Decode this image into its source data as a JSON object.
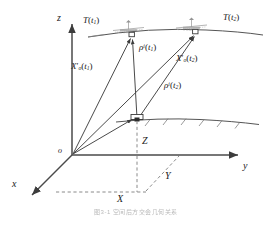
{
  "figure": {
    "type": "geometry-diagram",
    "title_caption": "图3-1   空间后方交会几何关系",
    "background_color": "#ffffff",
    "line_color": "#4a4a4a",
    "dash_color": "#8a8a8a",
    "text_color": "#1a1a1a"
  },
  "axes": {
    "z": {
      "label": "z",
      "dir": "up",
      "tip": [
        72,
        22
      ],
      "origin": [
        72,
        155
      ]
    },
    "y": {
      "label": "y",
      "dir": "right",
      "tip": [
        240,
        155
      ],
      "origin": [
        72,
        155
      ]
    },
    "x": {
      "label": "x",
      "dir": "down-left",
      "tip": [
        30,
        196
      ],
      "origin": [
        72,
        155
      ]
    },
    "origin_label": "o"
  },
  "labels": {
    "sat1": {
      "base": "T",
      "arg": "t",
      "argsub": "1"
    },
    "sat2": {
      "base": "T",
      "arg": "t",
      "argsub": "2"
    },
    "rho1": {
      "base": "ρ",
      "sup": "i",
      "arg": "t",
      "argsub": "1"
    },
    "rho2": {
      "base": "ρ",
      "sup": "i",
      "arg": "t",
      "argsub": "2"
    },
    "Xo1": {
      "base": "X",
      "prime": "′",
      "sub": "o",
      "arg": "t",
      "argsub": "1"
    },
    "Xo2": {
      "base": "X",
      "prime": "′",
      "sub": "o",
      "arg": "t",
      "argsub": "2"
    },
    "X": "X",
    "Y": "Y",
    "Z": "Z"
  },
  "points": {
    "origin": {
      "name": "o",
      "x": 72,
      "y": 155
    },
    "satellite1": {
      "name": "T(t1)",
      "x": 132,
      "y": 34
    },
    "satellite2": {
      "name": "T(t2)",
      "x": 196,
      "y": 31
    },
    "receiver": {
      "name": "station",
      "x": 137,
      "y": 119
    },
    "ground_proj": {
      "name": "ground-projection",
      "x": 137,
      "y": 155
    },
    "x_foot": {
      "name": "x-axis-foot",
      "x": 104,
      "y": 192
    },
    "xy_corner": {
      "name": "xy-corner",
      "x": 147,
      "y": 192
    }
  },
  "positions": {
    "z_label": {
      "left": 57,
      "top": 14
    },
    "y_label": {
      "left": 243,
      "top": 163
    },
    "x_label": {
      "left": 12,
      "top": 180
    },
    "o_label": {
      "left": 58,
      "top": 148
    },
    "sat1_label": {
      "left": 83,
      "top": 17
    },
    "sat2_label": {
      "left": 224,
      "top": 15
    },
    "rho1_label": {
      "left": 140,
      "top": 44
    },
    "rho2_label": {
      "left": 165,
      "top": 82
    },
    "Xo1_label": {
      "left": 72,
      "top": 63
    },
    "Xo2_label": {
      "left": 177,
      "top": 55
    },
    "Z_label": {
      "left": 143,
      "top": 138
    },
    "Y_label": {
      "left": 166,
      "top": 173
    },
    "X_label": {
      "left": 118,
      "top": 196
    }
  },
  "orbit": {
    "name": "satellite-orbit-arc",
    "path": "M 90 36 Q 150 27 205 30 Q 240 31 262 34"
  },
  "ground": {
    "name": "ground-surface",
    "path": "M 118 121 Q 160 117 200 119 Q 232 121 258 124",
    "hatch_count": 6
  },
  "satellite_icons": {
    "sat1": {
      "cx": 128,
      "cy": 27,
      "width": 30
    },
    "sat2": {
      "cx": 192,
      "cy": 24,
      "width": 30
    }
  },
  "vectors": [
    {
      "name": "vector-Xo-t1",
      "from": "origin",
      "to": "satellite1",
      "style": "solid-arrow"
    },
    {
      "name": "vector-Xo-t2",
      "from": "origin",
      "to": "satellite2",
      "style": "solid-arrow"
    },
    {
      "name": "vector-rho-t1",
      "from": "receiver",
      "to": "satellite1",
      "style": "solid-arrow"
    },
    {
      "name": "vector-rho-t2",
      "from": "receiver",
      "to": "satellite2",
      "style": "solid-arrow"
    },
    {
      "name": "vector-station",
      "from": "origin",
      "to": "receiver",
      "style": "solid-arrow"
    }
  ],
  "dashed": [
    {
      "name": "dash-Z-drop",
      "from": [
        137,
        119
      ],
      "to": [
        137,
        192
      ]
    },
    {
      "name": "dash-X-base",
      "from": [
        104,
        192
      ],
      "to": [
        147,
        192
      ]
    },
    {
      "name": "dash-Y-diag",
      "from": [
        147,
        192
      ],
      "to": [
        178,
        155
      ]
    }
  ]
}
